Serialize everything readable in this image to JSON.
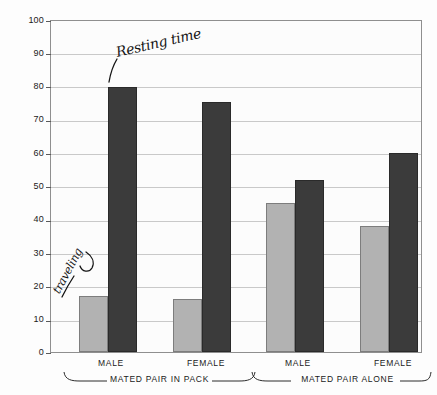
{
  "chart_data": {
    "type": "bar",
    "title": "",
    "subtitle": "",
    "xlabel": "",
    "ylabel": "PERCENT OF TIME",
    "ylim": [
      0,
      100
    ],
    "ytick_labels": [
      "0",
      "10",
      "20",
      "30",
      "40",
      "50",
      "60",
      "70",
      "80",
      "90",
      "100"
    ],
    "ytick_values": [
      0,
      10,
      20,
      30,
      40,
      50,
      60,
      70,
      80,
      90,
      100
    ],
    "grid": true,
    "legend_position": "none",
    "categories": [
      "MALE",
      "FEMALE",
      "MALE",
      "FEMALE"
    ],
    "groups": [
      {
        "label": "MATED PAIR IN PACK",
        "categories": [
          "MALE",
          "FEMALE"
        ]
      },
      {
        "label": "MATED PAIR ALONE",
        "categories": [
          "MALE",
          "FEMALE"
        ]
      }
    ],
    "series": [
      {
        "name": "traveling",
        "color": "#b2b2b2",
        "values": [
          17,
          16,
          45,
          38
        ]
      },
      {
        "name": "Resting time",
        "color": "#3b3b3b",
        "values": [
          80,
          75.5,
          52,
          60
        ]
      }
    ],
    "annotations": [
      {
        "text": "Resting time",
        "style": "handwritten",
        "points_to": "dark-bar-group1-male"
      },
      {
        "text": "traveling",
        "style": "handwritten",
        "points_to": "light-bar-group1-male"
      }
    ]
  },
  "colors": {
    "bar_light": "#b2b2b2",
    "bar_dark": "#3b3b3b",
    "gridline": "#c9c9c9",
    "frame": "#8f8f8f",
    "text": "#1a1a1a",
    "background": "#fdfdfd"
  }
}
